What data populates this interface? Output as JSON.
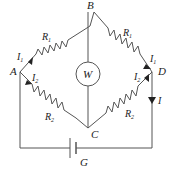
{
  "diagram": {
    "type": "wheatstone-bridge",
    "nodes": {
      "A": "A",
      "B": "B",
      "C": "C",
      "D": "D",
      "G": "G"
    },
    "meter_label": "W",
    "resistors": {
      "AB": {
        "label": "R",
        "sub": "1"
      },
      "BD": {
        "label": "R",
        "sub": "1"
      },
      "AC": {
        "label": "R",
        "sub": "2"
      },
      "CD": {
        "label": "R",
        "sub": "2"
      }
    },
    "currents": {
      "A_upper": {
        "label": "I",
        "sub": "1"
      },
      "A_lower": {
        "label": "I",
        "sub": "2"
      },
      "D_upper": {
        "label": "I",
        "sub": "1"
      },
      "D_lower": {
        "label": "I",
        "sub": "2"
      },
      "right_wire": {
        "label": "I",
        "sub": ""
      }
    },
    "battery_label": "G",
    "colors": {
      "wire": "#555555",
      "text": "#222222"
    }
  }
}
